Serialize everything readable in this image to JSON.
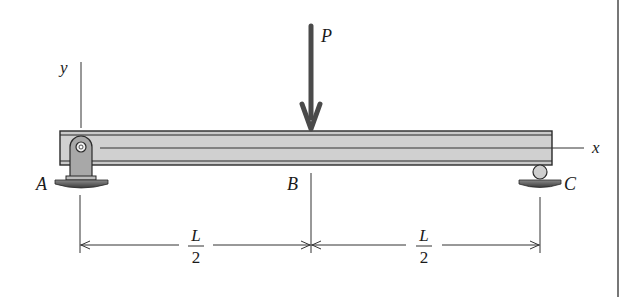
{
  "diagram": {
    "type": "simply-supported-beam",
    "labels": {
      "load": "P",
      "support_left": "A",
      "midpoint": "B",
      "support_right": "C",
      "axis_x": "x",
      "axis_y": "y"
    },
    "dimensions": [
      {
        "numerator": "L",
        "denominator": "2"
      },
      {
        "numerator": "L",
        "denominator": "2"
      }
    ],
    "colors": {
      "beam_fill": "#c8c8c8",
      "beam_edge": "#2a2a2a",
      "arrow": "#4a4a4a",
      "support": "#5a5a5a",
      "line": "#333333"
    }
  }
}
